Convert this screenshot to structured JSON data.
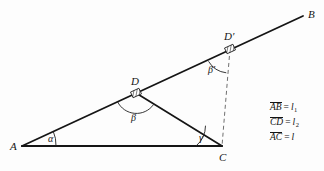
{
  "figure": {
    "vertices": [
      {
        "name": "A",
        "label": "A",
        "x": 22,
        "y": 146,
        "label_x": 10,
        "label_y": 141
      },
      {
        "name": "B",
        "label": "B",
        "x": 303,
        "y": 16,
        "label_x": 308,
        "label_y": 9
      },
      {
        "name": "C",
        "label": "C",
        "x": 222,
        "y": 146,
        "label_x": 219,
        "label_y": 152
      },
      {
        "name": "D",
        "label": "D",
        "x": 136,
        "y": 93,
        "label_x": 131,
        "label_y": 76
      },
      {
        "name": "Dprime",
        "label": "D′",
        "x": 230,
        "y": 49,
        "label_x": 224,
        "label_y": 31
      }
    ],
    "angles": [
      {
        "name": "alpha",
        "label": "α",
        "x": 48,
        "y": 134
      },
      {
        "name": "beta",
        "label": "β",
        "x": 131,
        "y": 113
      },
      {
        "name": "gamma",
        "label": "γ",
        "x": 199,
        "y": 133
      },
      {
        "name": "beta-prime",
        "label": "β′",
        "x": 208,
        "y": 65
      }
    ],
    "solid_edges": [
      {
        "name": "edge-AC",
        "from": "A",
        "to": "C",
        "width": 2.1
      },
      {
        "name": "edge-AB",
        "from": "A",
        "to": "B",
        "width": 1.8
      },
      {
        "name": "edge-DC",
        "from": "D",
        "to": "C",
        "width": 1.7
      }
    ],
    "dashed_edges": [
      {
        "name": "edge-Dprime-C",
        "from": "Dprime",
        "to": "C"
      }
    ],
    "colors": {
      "ink": "#151515",
      "background": "#fdfdfd",
      "dashed": "#6f6f6f"
    }
  },
  "legend": {
    "name": "measurements-legend",
    "rows": [
      {
        "segment": "AB",
        "equals": "=",
        "value": "l",
        "subscript": "1"
      },
      {
        "segment": "CD",
        "equals": "=",
        "value": "l",
        "subscript": "2"
      },
      {
        "segment": "AC",
        "equals": "=",
        "value": "l",
        "subscript": ""
      }
    ]
  }
}
